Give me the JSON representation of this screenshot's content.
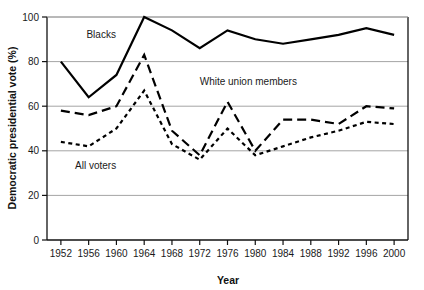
{
  "chart_data": {
    "type": "line",
    "title": "",
    "xlabel": "Year",
    "ylabel": "Democratic presidential vote (%)",
    "xlim": [
      1950,
      2002
    ],
    "ylim": [
      0,
      100
    ],
    "grid": "horizontal",
    "legend_position": "inline-annotations",
    "categories": [
      1952,
      1956,
      1960,
      1964,
      1968,
      1972,
      1976,
      1980,
      1984,
      1988,
      1992,
      1996,
      2000
    ],
    "x_tick_labels": [
      "1952",
      "1956",
      "1960",
      "1964",
      "1968",
      "1972",
      "1976",
      "1980",
      "1984",
      "1988",
      "1992",
      "1996",
      "2000"
    ],
    "y_tick_labels": [
      "0",
      "20",
      "40",
      "60",
      "80",
      "100"
    ],
    "y_ticks": [
      0,
      20,
      40,
      60,
      80,
      100
    ],
    "series": [
      {
        "name": "Blacks",
        "style": "solid",
        "color": "#000000",
        "width": 2.2,
        "values": [
          80,
          64,
          74,
          100,
          94,
          86,
          94,
          90,
          88,
          90,
          92,
          95,
          92
        ]
      },
      {
        "name": "White union members",
        "style": "long-dash",
        "color": "#000000",
        "width": 2.2,
        "values": [
          58,
          56,
          60,
          83,
          49,
          38,
          62,
          40,
          54,
          54,
          52,
          60,
          59
        ]
      },
      {
        "name": "All voters",
        "style": "short-dash",
        "color": "#000000",
        "width": 2.2,
        "values": [
          44,
          42,
          50,
          67,
          43,
          36,
          50,
          38,
          42,
          46,
          49,
          53,
          52
        ]
      }
    ],
    "annotations": [
      {
        "text": "Blacks",
        "x": 1957.8,
        "y": 90.5,
        "anchor": "middle"
      },
      {
        "text": "White union members",
        "x": 1979.0,
        "y": 69.5,
        "anchor": "middle"
      },
      {
        "text": "All voters",
        "x": 1957.0,
        "y": 32.0,
        "anchor": "middle"
      }
    ]
  }
}
